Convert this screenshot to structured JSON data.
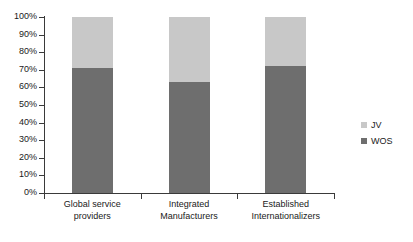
{
  "chart_data": {
    "type": "bar",
    "subtype": "100% stacked column",
    "title": "",
    "xlabel": "",
    "ylabel": "",
    "ylim": [
      0,
      100
    ],
    "ytick_labels": [
      "0%",
      "10%",
      "20%",
      "30%",
      "40%",
      "50%",
      "60%",
      "70%",
      "80%",
      "90%",
      "100%"
    ],
    "ytick_values": [
      0,
      10,
      20,
      30,
      40,
      50,
      60,
      70,
      80,
      90,
      100
    ],
    "grid": false,
    "legend_position": "right",
    "categories": [
      "Global service providers",
      "Integrated Manufacturers",
      "Established Internationalizers"
    ],
    "category_lines": [
      [
        "Global service",
        "providers"
      ],
      [
        "Integrated",
        "Manufacturers"
      ],
      [
        "Established",
        "Internationalizers"
      ]
    ],
    "series": [
      {
        "name": "JV",
        "color": "#c8c8c8",
        "values": [
          29,
          37,
          28
        ]
      },
      {
        "name": "WOS",
        "color": "#6e6e6e",
        "values": [
          71,
          63,
          72
        ]
      }
    ]
  },
  "legend": {
    "items": [
      {
        "label": "JV",
        "color": "#c8c8c8"
      },
      {
        "label": "WOS",
        "color": "#6e6e6e"
      }
    ]
  },
  "axis": {
    "line_color": "#3a3a3a"
  }
}
